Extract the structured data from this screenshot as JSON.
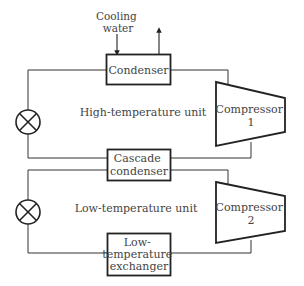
{
  "diagram": {
    "cooling_water": {
      "line1": "Cooling",
      "line2": "water"
    },
    "condenser": {
      "label": "Condenser"
    },
    "high_unit": {
      "label": "High-temperature unit"
    },
    "compressor1": {
      "line1": "Compressor",
      "line2": "1"
    },
    "cascade_condenser": {
      "line1": "Cascade",
      "line2": "condenser"
    },
    "low_unit": {
      "label": "Low-temperature unit"
    },
    "compressor2": {
      "line1": "Compressor",
      "line2": "2"
    },
    "low_exchanger": {
      "line1": "Low-",
      "line2": "temperature",
      "line3": "exchanger"
    },
    "expansion_valves": [
      "expansion-valve-high",
      "expansion-valve-low"
    ],
    "colors": {
      "line": "#222222",
      "text": "#444444",
      "background": "#ffffff"
    }
  }
}
